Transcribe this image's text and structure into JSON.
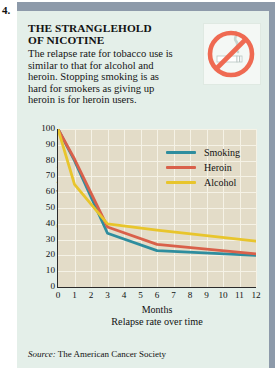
{
  "figure_number": "4.",
  "headline": "THE STRANGLEHOLD OF NICOTINE",
  "headline_line1": "THE STRANGLEHOLD",
  "headline_line2": "OF NICOTINE",
  "blurb": "The relapse rate for tobacco use is similar to that for alcohol and heroin. Stopping smoking is as hard for smokers as giving up heroin is for heroin users.",
  "icon": {
    "name": "no-smoking-icon",
    "ring_color": "#ef6a52",
    "cigarette_color": "#ffffff",
    "smoke_color": "#c8d6d2"
  },
  "source": {
    "label": "Source:",
    "text": "The American Cancer Society"
  },
  "colors": {
    "panel_background": "#e4efe9",
    "panel_bar": "#8d9aaa",
    "plot_background": "#e3dcc8",
    "grid": "#f5f2e6",
    "axis": "#2b2b2b",
    "smoking": "#2e8d9e",
    "heroin": "#d9604a",
    "alcohol": "#e8c52c"
  },
  "chart_data": {
    "type": "line",
    "title": "",
    "xlabel": "Months",
    "sub_caption": "Relapse rate over time",
    "ylabel": "Percent of abstainers",
    "xlim": [
      0,
      12
    ],
    "ylim": [
      0,
      100
    ],
    "xticks": [
      0,
      1,
      2,
      3,
      4,
      5,
      6,
      7,
      8,
      9,
      10,
      11,
      12
    ],
    "yticks": [
      0,
      10,
      20,
      30,
      40,
      50,
      60,
      70,
      80,
      90,
      100
    ],
    "grid": true,
    "legend_position": "upper-right-inside",
    "x": [
      0,
      1,
      3,
      6,
      12
    ],
    "series": [
      {
        "name": "Smoking",
        "color": "#2e8d9e",
        "values": [
          100,
          80,
          34,
          23,
          20
        ]
      },
      {
        "name": "Heroin",
        "color": "#d9604a",
        "values": [
          100,
          81,
          38,
          27,
          21
        ]
      },
      {
        "name": "Alcohol",
        "color": "#e8c52c",
        "values": [
          100,
          65,
          40,
          36,
          29
        ]
      }
    ]
  }
}
